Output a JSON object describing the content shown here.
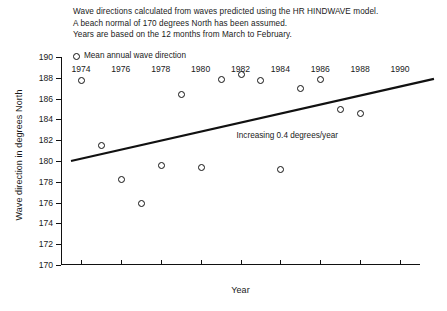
{
  "notes": [
    "Wave directions calculated from waves predicted using the HR HINDWAVE model.",
    "A beach normal of 170 degrees North has been assumed.",
    "Years are based on the 12 months from March to February."
  ],
  "legend": {
    "marker_icon": "open-circle-marker",
    "label": "Mean annual wave direction"
  },
  "chart_data": {
    "type": "scatter",
    "title": "",
    "xlabel": "Year",
    "ylabel": "Wave direction in degrees North",
    "xlim": [
      1973,
      1991
    ],
    "ylim": [
      170,
      190
    ],
    "xticks": [
      1974,
      1976,
      1978,
      1980,
      1982,
      1984,
      1986,
      1988,
      1990
    ],
    "yticks": [
      170,
      172,
      174,
      176,
      178,
      180,
      182,
      184,
      186,
      188,
      190
    ],
    "grid": false,
    "legend_position": "top-left",
    "series": [
      {
        "name": "Mean annual wave direction",
        "marker": "open-circle",
        "x": [
          1974,
          1975,
          1976,
          1977,
          1978,
          1979,
          1980,
          1981,
          1982,
          1983,
          1984,
          1985,
          1986,
          1987,
          1988
        ],
        "values": [
          187.8,
          181.5,
          178.3,
          176.0,
          179.6,
          186.4,
          179.4,
          187.9,
          188.4,
          187.8,
          179.2,
          187.0,
          187.9,
          185.0,
          184.6
        ]
      }
    ],
    "trendline": {
      "label": "Increasing 0.4 degrees/year",
      "slope_degrees_per_year": 0.4,
      "x_start": 1973.5,
      "y_start": 180.0,
      "x_end": 1991.7,
      "y_end": 187.9
    },
    "annotations": [
      {
        "text": "Increasing 0.4 degrees/year",
        "x": 1981.8,
        "y": 182.4
      }
    ]
  }
}
